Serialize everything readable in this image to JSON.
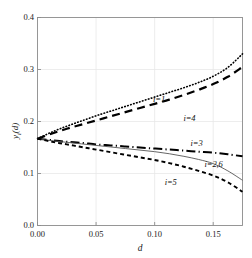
{
  "chart_data": {
    "type": "line",
    "title": "",
    "subtitle": "",
    "xlabel": "d",
    "ylabel": "y_i(d)",
    "ylabel_base": "y",
    "ylabel_sub": "i",
    "ylabel_arg": "(d)",
    "xlim": [
      0.0,
      0.175
    ],
    "ylim": [
      0.0,
      0.4
    ],
    "xticks": [
      0.0,
      0.05,
      0.1,
      0.15
    ],
    "xtick_labels": [
      "0.00",
      "0.05",
      "0.10",
      "0.15"
    ],
    "yticks": [
      0.0,
      0.1,
      0.2,
      0.3,
      0.4
    ],
    "ytick_labels": [
      "0.0",
      "0.1",
      "0.2",
      "0.3",
      "0.4"
    ],
    "grid": true,
    "grid_color": "#e8e8e8",
    "axis_color": "#8c8c8c",
    "legend_position": "inline-annotations",
    "x": [
      0.0,
      0.0125,
      0.025,
      0.0375,
      0.05,
      0.0625,
      0.075,
      0.0875,
      0.1,
      0.1125,
      0.125,
      0.1375,
      0.15,
      0.1625,
      0.175
    ],
    "series": [
      {
        "name": "i=1",
        "style": "dotted",
        "color": "#000000",
        "width": 1.6,
        "label": "i=1",
        "label_x": 0.108,
        "label_y": 0.243,
        "values": [
          0.167,
          0.18,
          0.191,
          0.201,
          0.211,
          0.22,
          0.229,
          0.238,
          0.247,
          0.256,
          0.265,
          0.275,
          0.287,
          0.304,
          0.33
        ]
      },
      {
        "name": "i=4",
        "style": "long-dash",
        "color": "#000000",
        "width": 2.2,
        "label": "i=4",
        "label_x": 0.134,
        "label_y": 0.205,
        "values": [
          0.167,
          0.177,
          0.186,
          0.194,
          0.202,
          0.21,
          0.218,
          0.226,
          0.234,
          0.242,
          0.251,
          0.261,
          0.272,
          0.286,
          0.305
        ]
      },
      {
        "name": "i=3",
        "style": "dash-dot",
        "color": "#000000",
        "width": 2.0,
        "label": "i=3",
        "label_x": 0.14,
        "label_y": 0.157,
        "values": [
          0.167,
          0.164,
          0.161,
          0.159,
          0.156,
          0.154,
          0.152,
          0.15,
          0.148,
          0.146,
          0.144,
          0.142,
          0.14,
          0.137,
          0.133
        ]
      },
      {
        "name": "i=2,6",
        "style": "solid-thin",
        "color": "#555555",
        "width": 0.9,
        "label": "i=2,6",
        "label_x": 0.152,
        "label_y": 0.117,
        "values": [
          0.167,
          0.163,
          0.16,
          0.157,
          0.154,
          0.151,
          0.148,
          0.145,
          0.142,
          0.138,
          0.133,
          0.127,
          0.119,
          0.105,
          0.087
        ]
      },
      {
        "name": "i=5",
        "style": "dashed",
        "color": "#000000",
        "width": 1.9,
        "label": "i=5",
        "label_x": 0.118,
        "label_y": 0.083,
        "values": [
          0.167,
          0.161,
          0.156,
          0.151,
          0.146,
          0.141,
          0.136,
          0.131,
          0.126,
          0.12,
          0.113,
          0.105,
          0.096,
          0.083,
          0.065
        ]
      }
    ]
  }
}
